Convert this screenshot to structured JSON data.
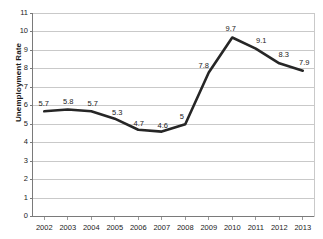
{
  "chart_data": {
    "type": "line",
    "title": "",
    "subtitle": "",
    "xlabel": "",
    "ylabel": "Unemployment Rate",
    "categories": [
      "2002",
      "2003",
      "2004",
      "2005",
      "2006",
      "2007",
      "2008",
      "2009",
      "2010",
      "2011",
      "2012",
      "2013"
    ],
    "values": [
      5.7,
      5.8,
      5.7,
      5.3,
      4.7,
      4.6,
      5,
      7.8,
      9.7,
      9.1,
      8.3,
      7.9
    ],
    "point_labels": [
      "5.7",
      "5.8",
      "5.7",
      "5.3",
      "4.7",
      "4.6",
      "5",
      "7.8",
      "9.7",
      "9.1",
      "8.3",
      "7.9"
    ],
    "ylim": [
      0,
      11
    ],
    "ytick_labels": [
      "0",
      "1",
      "2",
      "3",
      "4",
      "5",
      "6",
      "7",
      "8",
      "9",
      "10",
      "11"
    ],
    "ytick_values": [
      0,
      1,
      2,
      3,
      4,
      5,
      6,
      7,
      8,
      9,
      10,
      11
    ],
    "grid": true,
    "grid_axis": "y",
    "legend": false,
    "legend_position": "none",
    "series_color": "#262626",
    "grid_color": "#c9c9c9",
    "axis_color": "#8c8c8c",
    "text_color": "#222222",
    "background": "#ffffff",
    "line_width": 2.6,
    "markers": false
  }
}
